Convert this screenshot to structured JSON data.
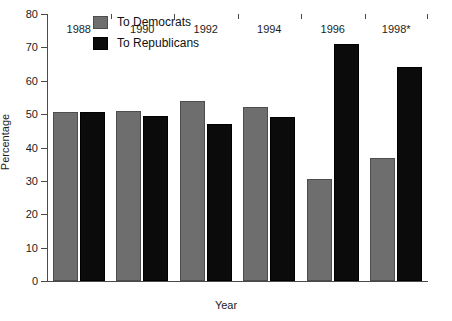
{
  "chart_data": {
    "type": "bar",
    "title": "",
    "xlabel": "Year",
    "ylabel": "Percentage",
    "ylim": [
      0,
      80
    ],
    "yticks": [
      0,
      10,
      20,
      30,
      40,
      50,
      60,
      70,
      80
    ],
    "grid": false,
    "legend_position": "top-left-inside",
    "categories": [
      "1988",
      "1990",
      "1992",
      "1994",
      "1996",
      "1998*"
    ],
    "series": [
      {
        "name": "To Democrats",
        "color": "#6e6e6e",
        "values": [
          50.5,
          51,
          54,
          52,
          30.5,
          37
        ]
      },
      {
        "name": "To Republicans",
        "color": "#0b0b0b",
        "values": [
          50.5,
          49.5,
          47,
          49,
          71,
          64
        ]
      }
    ]
  },
  "legend": {
    "items": [
      {
        "label": "To Democrats",
        "swatch": "gray-swatch"
      },
      {
        "label": "To Republicans",
        "swatch": "black-swatch"
      }
    ]
  },
  "caption": ""
}
